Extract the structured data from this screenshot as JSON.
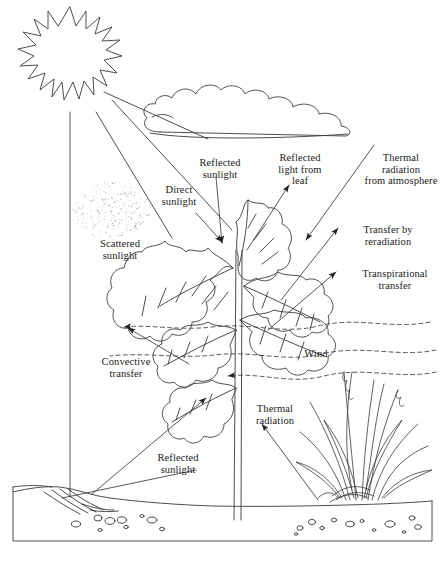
{
  "figure": {
    "kind": "energy-exchange-diagram",
    "style": "hand-drawn line art, black ink on white",
    "width": 445,
    "height": 562,
    "stroke_color": "#3a3a3a",
    "text_color": "#1a1a1a",
    "background": "#ffffff"
  },
  "labels": [
    {
      "id": "direct-sunlight",
      "text": "Direct\nsunlight",
      "x": 148,
      "y": 184,
      "w": 62
    },
    {
      "id": "scattered-sunlight",
      "text": "Scattered\nsunlight",
      "x": 85,
      "y": 238,
      "w": 70
    },
    {
      "id": "reflected-sunlight-top",
      "text": "Reflected\nsunlight",
      "x": 189,
      "y": 157,
      "w": 62
    },
    {
      "id": "reflected-light-leaf",
      "text": "Reflected\nlight from\nleaf",
      "x": 267,
      "y": 152,
      "w": 66
    },
    {
      "id": "thermal-radiation-atm",
      "text": "Thermal\nradiation\nfrom atmosphere",
      "x": 357,
      "y": 152,
      "w": 88
    },
    {
      "id": "transfer-reradiation",
      "text": "Transfer by\nreradiation",
      "x": 350,
      "y": 224,
      "w": 76
    },
    {
      "id": "transpirational",
      "text": "Transpirational\ntransfer",
      "x": 348,
      "y": 268,
      "w": 94
    },
    {
      "id": "wind",
      "text": "Wind",
      "x": 296,
      "y": 348,
      "w": 40
    },
    {
      "id": "convective-transfer",
      "text": "Convective\ntransfer",
      "x": 89,
      "y": 356,
      "w": 74
    },
    {
      "id": "thermal-radiation",
      "text": "Thermal\nradiation",
      "x": 243,
      "y": 403,
      "w": 64
    },
    {
      "id": "reflected-sunlight-bot",
      "text": "Reflected\nsunlight",
      "x": 146,
      "y": 452,
      "w": 64
    }
  ],
  "scene": {
    "sun": {
      "name": "sun",
      "cx": 70,
      "cy": 57,
      "r_inner": 31,
      "r_outer": 50,
      "rays": 17
    },
    "cloud": {
      "name": "cloud",
      "x": 148,
      "y": 86,
      "w": 220,
      "h": 52
    },
    "plant": {
      "name": "oak-plant",
      "stem_x": 239,
      "stem_top": 236,
      "stem_bottom": 520
    },
    "grass": {
      "name": "grass-clump",
      "x": 310,
      "y": 362,
      "w": 122,
      "h": 140
    },
    "ground": {
      "name": "soil-cross-section",
      "x": 13,
      "y": 487,
      "w": 420,
      "h": 54
    },
    "scatter_cloud": {
      "name": "scattered-light-stipple",
      "x": 72,
      "y": 182,
      "w": 78,
      "h": 58,
      "dots": 300
    },
    "wind_lines": {
      "name": "wind-streamlines",
      "count": 3,
      "y": [
        325,
        354,
        372
      ],
      "style": "dashed"
    }
  }
}
